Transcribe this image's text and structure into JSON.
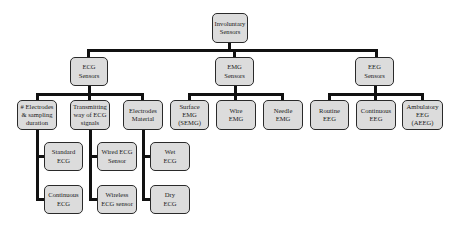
{
  "root": {
    "label": "Involuntary\nSensors"
  },
  "categories": [
    {
      "label": "ECG\nSensors"
    },
    {
      "label": "EMG\nSensors"
    },
    {
      "label": "EEG\nSensors"
    }
  ],
  "ecg_children": [
    {
      "label": "# Electrodes\n& sampling\nduration"
    },
    {
      "label": "Transmitting\nway of ECG\nsignals"
    },
    {
      "label": "Electrodes\nMaterial"
    }
  ],
  "emg_children": [
    {
      "label": "Surface\nEMG\n(SEMG)"
    },
    {
      "label": "Wire\nEMG"
    },
    {
      "label": "Needle\nEMG"
    }
  ],
  "eeg_children": [
    {
      "label": "Routine\nEEG"
    },
    {
      "label": "Continuous\nEEG"
    },
    {
      "label": "Ambulatory\nEEG\n(AEEG)"
    }
  ],
  "ecg_leaves": {
    "electrodes_sampling": [
      {
        "label": "Standard\nECG"
      },
      {
        "label": "Continuous\nECG"
      }
    ],
    "transmitting": [
      {
        "label": "Wired ECG\nSensor"
      },
      {
        "label": "Wireless\nECG sensor"
      }
    ],
    "material": [
      {
        "label": "Wet\nECG"
      },
      {
        "label": "Dry\nECG"
      }
    ]
  }
}
